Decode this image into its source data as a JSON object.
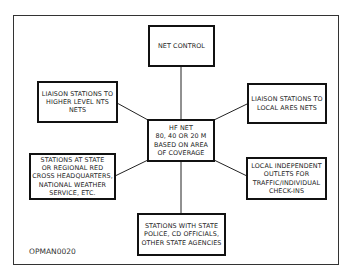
{
  "diagram": {
    "figure_id": "OPMAN0020",
    "center": "HF NET\n80, 40 OR 20 M\nBASED ON AREA\nOF COVERAGE",
    "nodes": {
      "top": "NET CONTROL",
      "upper_left": "LIAISON STATIONS TO\nHIGHER LEVEL NTS\nNETS",
      "upper_right": "LIAISON STATIONS TO\nLOCAL ARES NETS",
      "lower_left": "STATIONS AT STATE\nOR REGIONAL RED\nCROSS HEADQUARTERS,\nNATIONAL WEATHER\nSERVICE, ETC.",
      "lower_right": "LOCAL INDEPENDENT\nOUTLETS FOR\nTRAFFIC/INDIVIDUAL\nCHECK-INS",
      "bottom": "STATIONS WITH STATE\nPOLICE, CD OFFICIALS,\nOTHER STATE AGENCIES"
    },
    "edges": [
      [
        "center",
        "top"
      ],
      [
        "center",
        "upper_left"
      ],
      [
        "center",
        "upper_right"
      ],
      [
        "center",
        "lower_left"
      ],
      [
        "center",
        "lower_right"
      ],
      [
        "center",
        "bottom"
      ]
    ]
  }
}
